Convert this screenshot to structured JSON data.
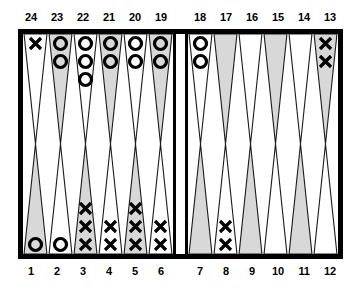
{
  "board": {
    "title": "backgammon-board",
    "colors": {
      "frame": "#000000",
      "background": "#ffffff",
      "point_shaded": "#d8d8d8",
      "point_light": "#ffffff",
      "point_outline": "#1a1a1a",
      "checker_dark": "#000000"
    },
    "top_labels": [
      "24",
      "23",
      "22",
      "21",
      "20",
      "19",
      "18",
      "17",
      "16",
      "15",
      "14",
      "13"
    ],
    "bottom_labels": [
      "1",
      "2",
      "3",
      "4",
      "5",
      "6",
      "7",
      "8",
      "9",
      "10",
      "11",
      "12"
    ],
    "checker_symbols": {
      "x": "X",
      "o": "O"
    },
    "quadrants": {
      "top_left": {
        "name": "opponent-home-outer-left",
        "points": [
          {
            "label": "24",
            "shade": "light",
            "checker": "x",
            "count": 1
          },
          {
            "label": "23",
            "shade": "shaded",
            "checker": "o",
            "count": 2
          },
          {
            "label": "22",
            "shade": "light",
            "checker": "o",
            "count": 3
          },
          {
            "label": "21",
            "shade": "shaded",
            "checker": "o",
            "count": 2
          },
          {
            "label": "20",
            "shade": "light",
            "checker": "o",
            "count": 2
          },
          {
            "label": "19",
            "shade": "shaded",
            "checker": "o",
            "count": 2
          }
        ]
      },
      "top_right": {
        "name": "opponent-outer-board-right",
        "points": [
          {
            "label": "18",
            "shade": "light",
            "checker": "o",
            "count": 2
          },
          {
            "label": "17",
            "shade": "shaded",
            "checker": null,
            "count": 0
          },
          {
            "label": "16",
            "shade": "light",
            "checker": null,
            "count": 0
          },
          {
            "label": "15",
            "shade": "shaded",
            "checker": null,
            "count": 0
          },
          {
            "label": "14",
            "shade": "light",
            "checker": null,
            "count": 0
          },
          {
            "label": "13",
            "shade": "shaded",
            "checker": "x",
            "count": 2
          }
        ]
      },
      "bottom_left": {
        "name": "player-home-board-left",
        "points": [
          {
            "label": "1",
            "shade": "shaded",
            "checker": "o",
            "count": 1
          },
          {
            "label": "2",
            "shade": "light",
            "checker": "o",
            "count": 1
          },
          {
            "label": "3",
            "shade": "shaded",
            "checker": "x",
            "count": 3
          },
          {
            "label": "4",
            "shade": "light",
            "checker": "x",
            "count": 2
          },
          {
            "label": "5",
            "shade": "shaded",
            "checker": "x",
            "count": 3
          },
          {
            "label": "6",
            "shade": "light",
            "checker": "x",
            "count": 2
          }
        ]
      },
      "bottom_right": {
        "name": "player-outer-board-right",
        "points": [
          {
            "label": "7",
            "shade": "shaded",
            "checker": null,
            "count": 0
          },
          {
            "label": "8",
            "shade": "light",
            "checker": "x",
            "count": 2
          },
          {
            "label": "9",
            "shade": "shaded",
            "checker": null,
            "count": 0
          },
          {
            "label": "10",
            "shade": "light",
            "checker": null,
            "count": 0
          },
          {
            "label": "11",
            "shade": "shaded",
            "checker": null,
            "count": 0
          },
          {
            "label": "12",
            "shade": "light",
            "checker": null,
            "count": 0
          }
        ]
      }
    }
  }
}
